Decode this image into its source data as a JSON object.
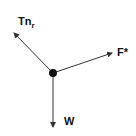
{
  "diagram": {
    "type": "free-body-diagram",
    "body": {
      "shape": "dot",
      "cx": 53,
      "cy": 73,
      "r": 4,
      "color": "#111111"
    },
    "forces": [
      {
        "id": "tension",
        "label": "Tn",
        "subscript": "r",
        "x2": 14,
        "y2": 33,
        "label_x": 18,
        "label_y": 25
      },
      {
        "id": "applied",
        "label": "F*",
        "subscript": "",
        "x2": 112,
        "y2": 53,
        "label_x": 117,
        "label_y": 56
      },
      {
        "id": "weight",
        "label": "W",
        "subscript": "",
        "x2": 53,
        "y2": 127,
        "label_x": 64,
        "label_y": 125
      }
    ],
    "line_color": "#333333"
  }
}
